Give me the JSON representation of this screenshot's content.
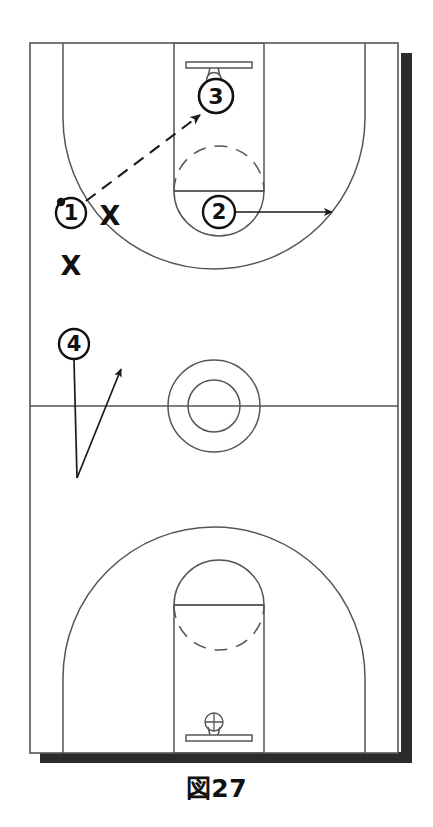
{
  "figure": {
    "caption": "図27",
    "type": "basketball-play-diagram",
    "orientation": "vertical-full-court"
  },
  "court": {
    "bounds": {
      "x": 30,
      "y": 43,
      "width": 368,
      "height": 710
    },
    "shadow_color": "#2b2b2b",
    "line_color": "#555555",
    "background": "#ffffff",
    "midcourt_line_y": 406,
    "center_circle": {
      "cx": 214,
      "cy": 406,
      "outer_r": 46,
      "inner_r": 26
    },
    "top_basket": {
      "paint": {
        "x": 174,
        "y": 43,
        "width": 90,
        "height": 148
      },
      "free_throw_line_y": 191,
      "backboard": {
        "x1": 186,
        "x2": 252,
        "y": 63
      },
      "hoop": {
        "cx": 214,
        "cy": 76,
        "r": 7
      },
      "three_point_arc_top_y": 43,
      "restricted_arc_dashed": true
    },
    "bottom_basket": {
      "paint": {
        "x": 174,
        "y": 605,
        "width": 90,
        "height": 148
      },
      "free_throw_line_y": 605,
      "backboard": {
        "x1": 186,
        "x2": 252,
        "y": 738
      },
      "hoop": {
        "cx": 214,
        "cy": 727,
        "r": 8
      }
    }
  },
  "players": [
    {
      "id": "player-1",
      "label": "1",
      "cx": 71,
      "cy": 213,
      "r": 15,
      "has_ball": true,
      "ball_dot": {
        "cx": 61,
        "cy": 202,
        "r": 4
      }
    },
    {
      "id": "player-2",
      "label": "2",
      "cx": 219,
      "cy": 212,
      "r": 16,
      "has_ball": false
    },
    {
      "id": "player-3",
      "label": "3",
      "cx": 216,
      "cy": 96,
      "r": 17,
      "has_ball": false
    },
    {
      "id": "player-4",
      "label": "4",
      "cx": 74,
      "cy": 344,
      "r": 15,
      "has_ball": false
    }
  ],
  "defenders": [
    {
      "id": "defender-x1",
      "label": "X",
      "x": 110,
      "y": 214
    },
    {
      "id": "defender-x2",
      "label": "X",
      "x": 71,
      "y": 264
    }
  ],
  "movements": [
    {
      "id": "pass-1-to-3",
      "kind": "pass",
      "style": "dashed",
      "from": "player-1",
      "to": "player-3",
      "path": "M 86 200 L 202 114"
    },
    {
      "id": "cut-2-right",
      "kind": "cut",
      "style": "solid",
      "from": "player-2",
      "path": "M 236 212 L 336 212"
    },
    {
      "id": "cut-4-up",
      "kind": "cut",
      "style": "solid",
      "from": "player-4",
      "path": "M 74 359 L 77 478 L 120 367"
    }
  ],
  "colors": {
    "line": "#555555",
    "marker": "#111111",
    "shadow": "#2b2b2b",
    "paper": "#ffffff"
  }
}
